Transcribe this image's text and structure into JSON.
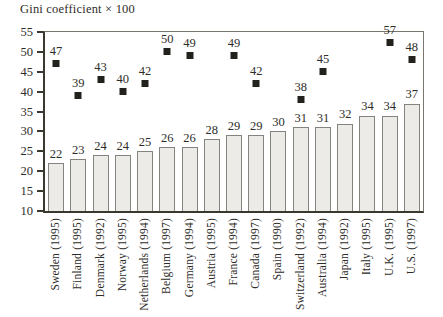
{
  "title": "Gini coefficient × 100",
  "chart_data": {
    "type": "bar",
    "title": "Gini coefficient × 100",
    "categories": [
      "Sweden (1995)",
      "Finland (1995)",
      "Denmark (1992)",
      "Norway (1995)",
      "Netherlands (1994)",
      "Belgium (1997)",
      "Germany (1994)",
      "Austria (1995)",
      "France (1994)",
      "Canada (1997)",
      "Spain (1990)",
      "Switzerland (1992)",
      "Australia (1994)",
      "Japan (1992)",
      "Italy (1995)",
      "U.K. (1995)",
      "U.S. (1997)"
    ],
    "series": [
      {
        "name": "bars",
        "marker": "gray-bar",
        "values": [
          22,
          23,
          24,
          24,
          25,
          26,
          26,
          28,
          29,
          29,
          30,
          31,
          31,
          32,
          34,
          34,
          37
        ]
      },
      {
        "name": "square-markers",
        "marker": "filled-black-square",
        "values": [
          47,
          39,
          43,
          40,
          42,
          50,
          49,
          null,
          49,
          42,
          null,
          38,
          45,
          null,
          null,
          57,
          48
        ]
      }
    ],
    "xlabel": "",
    "ylabel": "",
    "ylim": [
      10,
      55
    ],
    "yticks": [
      10,
      15,
      20,
      25,
      30,
      35,
      40,
      45,
      50,
      55
    ],
    "grid": false,
    "legend": "none",
    "data_labels": true
  },
  "colors": {
    "background": "#ffffff",
    "text": "#2e2c28",
    "bar_fill": "#edebe7",
    "bar_border": "#85837d",
    "marker": "#23211c",
    "axis_dark": "#3a382f",
    "axis_light": "#78766e"
  }
}
